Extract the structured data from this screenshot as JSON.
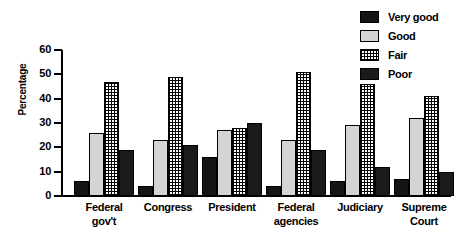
{
  "chart_data": {
    "type": "bar",
    "title": "",
    "subtitle": "",
    "xlabel": "",
    "ylabel": "Percentage",
    "ylim": [
      0,
      60
    ],
    "yticks": [
      0,
      10,
      20,
      30,
      40,
      50,
      60
    ],
    "ytick_labels": [
      "0",
      "10",
      "20",
      "30",
      "40",
      "50",
      "60"
    ],
    "grid": false,
    "legend_position": "top-right",
    "grouped": true,
    "categories": [
      "Federal gov't",
      "Congress",
      "President",
      "Federal agencies",
      "Judiciary",
      "Supreme Court"
    ],
    "category_lines": [
      [
        "Federal",
        "gov't"
      ],
      [
        "Congress"
      ],
      [
        "President"
      ],
      [
        "Federal",
        "agencies"
      ],
      [
        "Judiciary"
      ],
      [
        "Supreme",
        "Court"
      ]
    ],
    "series": [
      {
        "name": "Very good",
        "fill": "solid-black",
        "color": "#151515",
        "values": [
          6,
          4,
          16,
          4,
          6,
          7
        ]
      },
      {
        "name": "Good",
        "fill": "solid-light-gray",
        "color": "#d4d4d4",
        "values": [
          26,
          23,
          27,
          23,
          29,
          32
        ]
      },
      {
        "name": "Fair",
        "fill": "cross-hatch-grid",
        "color": "#ffffff",
        "values": [
          47,
          49,
          28,
          51,
          46,
          41
        ]
      },
      {
        "name": "Poor",
        "fill": "solid-dark",
        "color": "#1a1a1a",
        "values": [
          19,
          21,
          30,
          19,
          12,
          10
        ]
      }
    ]
  },
  "legend": {
    "items": [
      {
        "label": "Very good",
        "swatch": "legend-swatch-very-good"
      },
      {
        "label": "Good",
        "swatch": "legend-swatch-good"
      },
      {
        "label": "Fair",
        "swatch": "legend-swatch-fair"
      },
      {
        "label": "Poor",
        "swatch": "legend-swatch-poor"
      }
    ]
  }
}
